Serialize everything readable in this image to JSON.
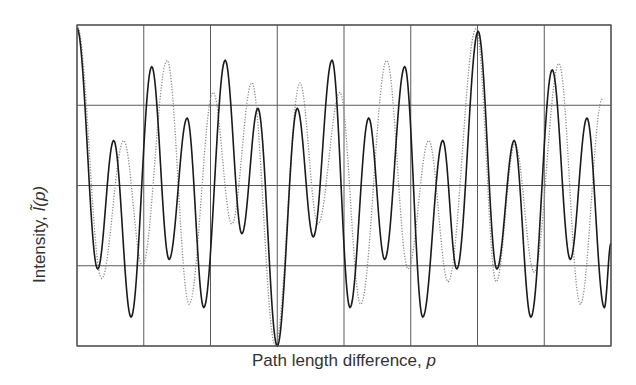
{
  "chart_data": {
    "type": "line",
    "title": "",
    "xlabel": "Path length difference, p",
    "ylabel": "Intensity, Ĩ(p)",
    "xlim": [
      0,
      8
    ],
    "ylim": [
      0,
      1
    ],
    "grid": true,
    "x_gridlines": [
      0,
      1,
      2,
      3,
      4,
      5,
      6,
      7,
      8
    ],
    "y_gridlines": [
      0,
      0.25,
      0.5,
      0.75,
      1
    ],
    "tick_labels_shown": false,
    "legend": null,
    "series": [
      {
        "name": "solid",
        "style": "solid",
        "color": "#1a1a1a",
        "extrema": [
          [
            0.0,
            0.99
          ],
          [
            0.31,
            0.24
          ],
          [
            0.55,
            0.64
          ],
          [
            0.81,
            0.09
          ],
          [
            1.12,
            0.87
          ],
          [
            1.38,
            0.27
          ],
          [
            1.65,
            0.71
          ],
          [
            1.9,
            0.12
          ],
          [
            2.22,
            0.89
          ],
          [
            2.47,
            0.35
          ],
          [
            2.71,
            0.74
          ],
          [
            3.0,
            0.0
          ],
          [
            3.3,
            0.74
          ],
          [
            3.54,
            0.34
          ],
          [
            3.82,
            0.89
          ],
          [
            4.09,
            0.12
          ],
          [
            4.37,
            0.71
          ],
          [
            4.61,
            0.27
          ],
          [
            4.91,
            0.87
          ],
          [
            5.18,
            0.09
          ],
          [
            5.48,
            0.64
          ],
          [
            5.69,
            0.24
          ],
          [
            6.01,
            0.98
          ],
          [
            6.29,
            0.24
          ],
          [
            6.55,
            0.64
          ],
          [
            6.8,
            0.09
          ],
          [
            7.12,
            0.86
          ],
          [
            7.39,
            0.27
          ],
          [
            7.64,
            0.71
          ],
          [
            7.9,
            0.12
          ],
          [
            8.0,
            0.32
          ]
        ]
      },
      {
        "name": "dotted",
        "style": "dotted",
        "color": "#8a8a8a",
        "extrema": [
          [
            0.0,
            1.0
          ],
          [
            0.37,
            0.21
          ],
          [
            0.7,
            0.64
          ],
          [
            0.98,
            0.25
          ],
          [
            1.35,
            0.89
          ],
          [
            1.68,
            0.13
          ],
          [
            2.04,
            0.79
          ],
          [
            2.32,
            0.38
          ],
          [
            2.62,
            0.82
          ],
          [
            2.97,
            0.0
          ],
          [
            3.34,
            0.82
          ],
          [
            3.61,
            0.38
          ],
          [
            3.94,
            0.79
          ],
          [
            4.25,
            0.13
          ],
          [
            4.64,
            0.89
          ],
          [
            4.96,
            0.24
          ],
          [
            5.27,
            0.64
          ],
          [
            5.56,
            0.2
          ],
          [
            5.98,
            0.99
          ],
          [
            6.28,
            0.2
          ],
          [
            6.56,
            0.63
          ],
          [
            6.85,
            0.23
          ],
          [
            7.22,
            0.88
          ],
          [
            7.54,
            0.13
          ],
          [
            7.87,
            0.77
          ]
        ]
      }
    ]
  },
  "labels": {
    "x_text": "Path length difference, ",
    "x_var": "p",
    "y_text": "Intensity, ",
    "y_var": "Ĩ(p)"
  },
  "style": {
    "grid_color": "#5a5a5a",
    "frame_color": "#555555",
    "plot_box": {
      "left": 77,
      "top": 25,
      "right": 611,
      "bottom": 346
    }
  }
}
